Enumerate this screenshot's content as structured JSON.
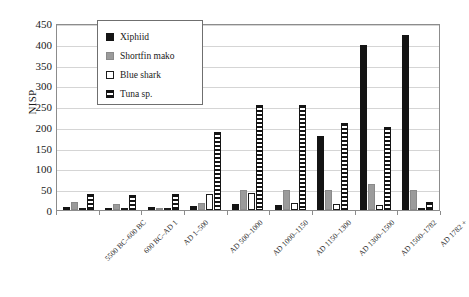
{
  "chart_data": {
    "type": "bar",
    "title": "",
    "xlabel": "",
    "ylabel": "NISP",
    "ylim": [
      0,
      450
    ],
    "ytick_step": 50,
    "yticks": [
      450,
      400,
      350,
      300,
      250,
      200,
      150,
      100,
      50,
      0
    ],
    "grid": true,
    "legend_position": "upper-left-inside",
    "categories": [
      "5500 BC–600 BC",
      "600 BC–AD 1",
      "AD 1–500",
      "AD 500–1000",
      "AD 1000–1150",
      "AD 1150–1300",
      "AD 1300–1500",
      "AD 1500–1782",
      "AD 1782 +"
    ],
    "series": [
      {
        "name": "Xiphiid",
        "color": "#141414",
        "fill": "solid-black",
        "values": [
          8,
          3,
          8,
          10,
          14,
          13,
          178,
          398,
          420
        ]
      },
      {
        "name": "Shortfin mako",
        "color": "#9b9b9b",
        "fill": "solid-gray",
        "values": [
          20,
          14,
          5,
          18,
          48,
          48,
          48,
          62,
          48
        ]
      },
      {
        "name": "Blue shark",
        "color": "#ffffff",
        "fill": "white-outlined",
        "values": [
          2,
          1,
          2,
          38,
          40,
          18,
          14,
          12,
          5
        ]
      },
      {
        "name": "Tuna sp.",
        "color": "#ffffff",
        "fill": "horizontal-hatch",
        "values": [
          38,
          35,
          38,
          188,
          252,
          252,
          210,
          200,
          20
        ]
      }
    ]
  },
  "legend": {
    "items": [
      {
        "label": "Xiphiid",
        "swatch": "xiphiid"
      },
      {
        "label": "Shortfin mako",
        "swatch": "mako"
      },
      {
        "label": "Blue shark",
        "swatch": "blueshark"
      },
      {
        "label": "Tuna sp.",
        "swatch": "tuna"
      }
    ]
  }
}
